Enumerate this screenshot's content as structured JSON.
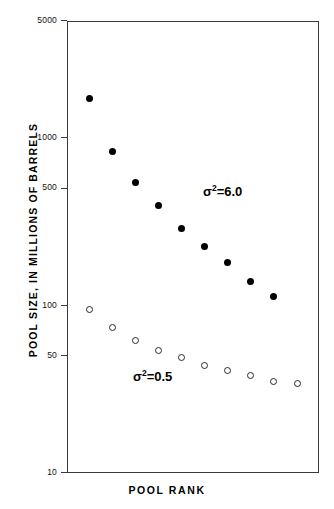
{
  "chart_data": {
    "type": "scatter",
    "title": "",
    "xlabel": "POOL RANK",
    "ylabel": "POOL SIZE, IN MILLIONS OF BARRELS",
    "yscale": "log",
    "ylim": [
      10,
      5000
    ],
    "ytick_labels": [
      "5000",
      "1000",
      "500",
      "100",
      "50",
      "10"
    ],
    "ytick_values": [
      5000,
      1000,
      500,
      100,
      50,
      10
    ],
    "grid": false,
    "legend_position": "inline-annotation",
    "xaxis_ticks_shown": false,
    "series": [
      {
        "name": "sigma^2 = 6.0",
        "marker": "filled-circle",
        "color": "#000000",
        "annotation": "σ²=6.0",
        "x": [
          1,
          2,
          3,
          4,
          5,
          6,
          7,
          8,
          9
        ],
        "values": [
          1720,
          830,
          545,
          395,
          290,
          225,
          180,
          140,
          113
        ]
      },
      {
        "name": "sigma^2 = 0.5",
        "marker": "open-circle",
        "color": "#2b2b2b",
        "annotation": "σ²=0.5",
        "x": [
          1,
          2,
          3,
          4,
          5,
          6,
          7,
          8,
          9,
          10
        ],
        "values": [
          95,
          74,
          62,
          54,
          49,
          44,
          41,
          38,
          35,
          34
        ]
      }
    ],
    "annotations": [
      {
        "text_sigma": "σ",
        "text_sup": "2",
        "text_rest": "=6.0",
        "series": "sigma^2 = 6.0"
      },
      {
        "text_sigma": "σ",
        "text_sup": "2",
        "text_rest": "=0.5",
        "series": "sigma^2 = 0.5"
      }
    ]
  },
  "axes": {
    "y_title": "POOL SIZE, IN MILLIONS OF BARRELS",
    "x_title": "POOL RANK",
    "y_ticks": [
      {
        "label": "5000"
      },
      {
        "label": "1000"
      },
      {
        "label": "500"
      },
      {
        "label": "100"
      },
      {
        "label": "50"
      },
      {
        "label": "10"
      }
    ]
  },
  "colors": {
    "frame": "#3a3a3a",
    "filled_marker": "#000000",
    "open_marker_stroke": "#2b2b2b",
    "text": "#000000",
    "background": "#ffffff"
  }
}
